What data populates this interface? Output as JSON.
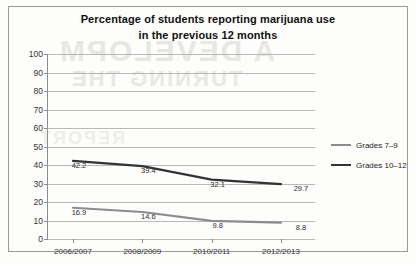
{
  "chart_data": {
    "type": "line",
    "title": "Percentage of students reporting marijuana use in the previous 12 months",
    "title_lines": [
      "Percentage of students reporting marijuana use",
      "in the previous 12 months"
    ],
    "xlabel": "",
    "ylabel": "",
    "categories": [
      "2006/2007",
      "2008/2009",
      "2010/2011",
      "2012/2013"
    ],
    "ylim": [
      0,
      100
    ],
    "ytick_step": 10,
    "yticks": [
      100,
      90,
      80,
      70,
      60,
      50,
      40,
      30,
      20,
      10,
      0
    ],
    "grid": true,
    "legend_position": "right",
    "series": [
      {
        "name": "Grades 7–9",
        "color": "#8c8c8c",
        "values": [
          16.9,
          14.6,
          9.8,
          8.8
        ],
        "labels": [
          "16.9",
          "14.6",
          "9.8",
          "8.8"
        ]
      },
      {
        "name": "Grades 10–12",
        "color": "#333333",
        "values": [
          42.2,
          39.4,
          32.1,
          29.7
        ],
        "labels": [
          "42.2",
          "39.4",
          "32.1",
          "29.7"
        ]
      }
    ]
  },
  "scan_artifacts": {
    "bleed_1": "A DEVELOPM",
    "bleed_2": "TURNING THE",
    "bleed_3": "REPORT"
  }
}
